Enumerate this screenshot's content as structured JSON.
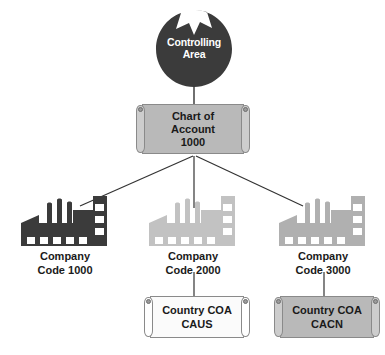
{
  "diagram": {
    "background_color": "#ffffff",
    "line_color": "#333333",
    "nodes": {
      "controlling_area": {
        "label_line1": "Controlling",
        "label_line2": "Area",
        "shape": "notched-circle",
        "fill_color": "#3b3b3b",
        "text_color": "#ffffff"
      },
      "chart_of_account": {
        "label_line1": "Chart of",
        "label_line2": "Account",
        "label_line3": "1000",
        "shape": "scroll",
        "fill_color": "#b9b9b9",
        "text_color": "#1a1a1a"
      },
      "company_1000": {
        "icon": "factory-icon",
        "icon_color": "#3b3b3b",
        "label_line1": "Company",
        "label_line2": "Code 1000"
      },
      "company_2000": {
        "icon": "factory-icon",
        "icon_color": "#c2c2c2",
        "label_line1": "Company",
        "label_line2": "Code 2000"
      },
      "company_3000": {
        "icon": "factory-icon",
        "icon_color": "#b0b0b0",
        "label_line1": "Company",
        "label_line2": "Code 3000"
      },
      "country_coa_caus": {
        "label_line1": "Country COA",
        "label_line2": "CAUS",
        "shape": "scroll",
        "fill_color": "#fbfbfb",
        "text_color": "#1a1a1a"
      },
      "country_coa_cacn": {
        "label_line1": "Country COA",
        "label_line2": "CACN",
        "shape": "scroll",
        "fill_color": "#b9b9b9",
        "text_color": "#1a1a1a"
      }
    }
  }
}
